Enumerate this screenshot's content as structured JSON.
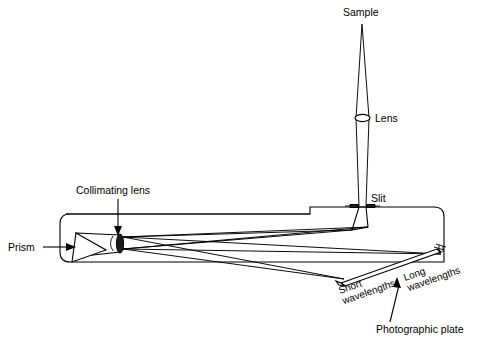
{
  "figure": {
    "labels": {
      "sample": "Sample",
      "lens": "Lens",
      "slit": "Slit",
      "collimating_lens": "Collimating lens",
      "prism": "Prism",
      "short_wavelengths_line1": "Short",
      "short_wavelengths_line2": "wavelengths",
      "long_wavelengths_line1": "Long",
      "long_wavelengths_line2": "wavelengths",
      "photographic_plate": "Photographic plate"
    },
    "colors": {
      "ink": "#000000",
      "background": "#ffffff",
      "lens_fill": "#1b1b1b"
    },
    "components": [
      "sample",
      "lens",
      "slit",
      "spectrograph-housing",
      "collimating-lens",
      "prism",
      "photographic-plate"
    ]
  }
}
